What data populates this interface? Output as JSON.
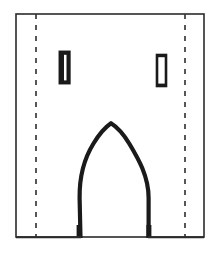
{
  "figure": {
    "medium": "ink line drawing",
    "canvas": {
      "width": 220,
      "height": 254,
      "background_color": "#ffffff"
    },
    "palette": {
      "ink": "#1a1a1a",
      "outline": "#2b2b2b",
      "dashed_guide": "#3a3a3a",
      "background": "#ffffff"
    }
  },
  "elements": {
    "wall_outline": {
      "name": "facade-wall-rectangle",
      "description": "Outer rectangular wall elevation, open at nothing; thin ink outline",
      "x": 16,
      "y": 14,
      "width": 188,
      "height": 223,
      "stroke_width": 1.6,
      "stroke_color": "#2b2b2b",
      "fill": "none"
    },
    "guide_left": {
      "name": "dashed-guide-line-left",
      "description": "Vertical dashed construction/guide line near left edge",
      "x": 36,
      "y_top": 14,
      "y_bottom": 237,
      "stroke_width": 1.6,
      "stroke_color": "#3a3a3a",
      "dash_pattern": "5 6"
    },
    "guide_right": {
      "name": "dashed-guide-line-right",
      "description": "Vertical dashed construction/guide line near right edge",
      "x": 185,
      "y_top": 14,
      "y_bottom": 237,
      "stroke_width": 1.6,
      "stroke_color": "#3a3a3a",
      "dash_pattern": "5 6"
    },
    "window_left": {
      "name": "window-slit-left",
      "description": "Narrow vertical loophole window, heavily inked / nearly solid",
      "x": 60,
      "y": 52,
      "width": 9,
      "height": 31,
      "stroke_width": 2.6,
      "stroke_color": "#1a1a1a",
      "fill": "#ffffff",
      "appearance": "dark-filled"
    },
    "window_right": {
      "name": "window-slit-right",
      "description": "Narrow vertical loophole window, outlined hollow",
      "x": 157,
      "y": 55,
      "width": 9,
      "height": 31,
      "stroke_width": 2.4,
      "stroke_color": "#1a1a1a",
      "fill": "#ffffff",
      "appearance": "outlined-hollow"
    },
    "portal_arch": {
      "name": "pointed-arch-portal",
      "description": "Ogival / pointed arch doorway opening rising from the ground line",
      "left_jamb_x": 79,
      "right_jamb_x": 149,
      "base_y": 237,
      "spring_y": 183,
      "apex_x": 111,
      "apex_y": 123,
      "stroke_width": 4.2,
      "stroke_color": "#1a1a1a",
      "fill": "none",
      "path": "M 80 238 L 79.5 196 C 79.5 175 84 158 93 143 C 99 133 105 127 111 123.5 C 117.5 127 124 134 130 144 C 139 159 148.5 176 148.5 197 L 148.5 238"
    }
  },
  "chart_data": {
    "type": "line",
    "xlabel": "",
    "ylabel": "",
    "grid": false,
    "legend": "none",
    "xlim": [
      0,
      220
    ],
    "ylim": [
      0,
      254
    ],
    "series": [
      {
        "name": "facade-wall-rectangle",
        "kind": "rectangle",
        "x": [
          16,
          204,
          204,
          16,
          16
        ],
        "y": [
          14,
          14,
          237,
          237,
          14
        ]
      },
      {
        "name": "dashed-guide-line-left",
        "kind": "dashed-vertical",
        "x": [
          36,
          36
        ],
        "y": [
          14,
          237
        ]
      },
      {
        "name": "dashed-guide-line-right",
        "kind": "dashed-vertical",
        "x": [
          185,
          185
        ],
        "y": [
          14,
          237
        ]
      },
      {
        "name": "window-slit-left",
        "kind": "rectangle",
        "x": [
          60,
          69,
          69,
          60,
          60
        ],
        "y": [
          52,
          52,
          83,
          83,
          52
        ]
      },
      {
        "name": "window-slit-right",
        "kind": "rectangle",
        "x": [
          157,
          166,
          166,
          157,
          157
        ],
        "y": [
          55,
          55,
          86,
          86,
          55
        ]
      },
      {
        "name": "pointed-arch-portal",
        "kind": "open-curve",
        "x": [
          80,
          79,
          82,
          93,
          103,
          111,
          120,
          130,
          142,
          148,
          149
        ],
        "y": [
          238,
          196,
          168,
          143,
          130,
          123,
          130,
          144,
          168,
          197,
          238
        ]
      }
    ]
  }
}
